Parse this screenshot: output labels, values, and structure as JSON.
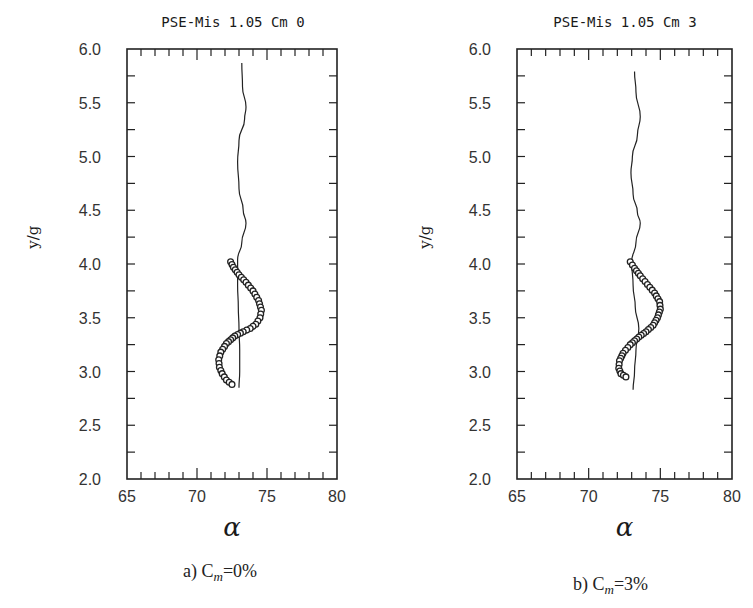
{
  "figure": {
    "panels": [
      {
        "id": "a",
        "title": "PSE-Mis  1.05  Cm  0",
        "ylabel": "y/g",
        "xlabel": "α",
        "caption_prefix": "a) C",
        "caption_sub": "m",
        "caption_suffix": "=0%",
        "xticks": [
          "65",
          "70",
          "75",
          "80"
        ],
        "yticks": [
          "2.0",
          "2.5",
          "3.0",
          "3.5",
          "4.0",
          "4.5",
          "5.0",
          "5.5",
          "6.0"
        ]
      },
      {
        "id": "b",
        "title": "PSE-Mis  1.05  Cm  3",
        "ylabel": "y/g",
        "xlabel": "α",
        "caption_prefix": "b) C",
        "caption_sub": "m",
        "caption_suffix": "=3%",
        "xticks": [
          "65",
          "70",
          "75",
          "80"
        ],
        "yticks": [
          "2.0",
          "2.5",
          "3.0",
          "3.5",
          "4.0",
          "4.5",
          "5.0",
          "5.5",
          "6.0"
        ]
      }
    ]
  },
  "chart_data": [
    {
      "type": "line",
      "title": "PSE-Mis 1.05 Cm 0",
      "caption": "a) Cm=0%",
      "xlabel": "α",
      "ylabel": "y/g",
      "xlim": [
        65,
        80
      ],
      "ylim": [
        2.0,
        6.0
      ],
      "xticks": [
        65,
        70,
        75,
        80
      ],
      "yticks": [
        2.0,
        2.5,
        3.0,
        3.5,
        4.0,
        4.5,
        5.0,
        5.5,
        6.0
      ],
      "grid": false,
      "legend": null,
      "series": [
        {
          "name": "line",
          "style": "solid line",
          "x": [
            73.2,
            73.25,
            73.5,
            73.4,
            73.0,
            72.9,
            73.0,
            73.3,
            73.5,
            73.2,
            72.9,
            72.9,
            72.95,
            73.0,
            73.05,
            73.05,
            73.0
          ],
          "y": [
            5.87,
            5.65,
            5.46,
            5.35,
            5.15,
            4.95,
            4.7,
            4.5,
            4.38,
            4.2,
            4.04,
            3.8,
            3.6,
            3.4,
            3.2,
            3.0,
            2.85
          ]
        },
        {
          "name": "circles",
          "style": "open circle markers",
          "x": [
            72.4,
            72.6,
            73.0,
            73.5,
            74.0,
            74.4,
            74.6,
            74.5,
            74.2,
            73.8,
            73.3,
            72.7,
            72.1,
            71.7,
            71.55,
            71.6,
            71.8,
            72.1,
            72.5
          ],
          "y": [
            4.02,
            3.97,
            3.9,
            3.83,
            3.75,
            3.66,
            3.57,
            3.5,
            3.44,
            3.4,
            3.37,
            3.33,
            3.26,
            3.18,
            3.11,
            3.04,
            2.98,
            2.92,
            2.88
          ]
        }
      ]
    },
    {
      "type": "line",
      "title": "PSE-Mis 1.05 Cm 3",
      "caption": "b) Cm=3%",
      "xlabel": "α",
      "ylabel": "y/g",
      "xlim": [
        65,
        80
      ],
      "ylim": [
        2.0,
        6.0
      ],
      "xticks": [
        65,
        70,
        75,
        80
      ],
      "yticks": [
        2.0,
        2.5,
        3.0,
        3.5,
        4.0,
        4.5,
        5.0,
        5.5,
        6.0
      ],
      "grid": false,
      "legend": null,
      "series": [
        {
          "name": "line",
          "style": "solid line",
          "x": [
            73.2,
            73.3,
            73.6,
            73.4,
            73.05,
            72.95,
            73.1,
            73.4,
            73.6,
            73.3,
            73.0,
            73.1,
            73.25,
            73.5,
            73.3,
            73.2,
            73.1
          ],
          "y": [
            5.79,
            5.6,
            5.37,
            5.2,
            5.0,
            4.85,
            4.65,
            4.48,
            4.38,
            4.2,
            4.02,
            3.8,
            3.6,
            3.4,
            3.2,
            3.0,
            2.83
          ]
        },
        {
          "name": "circles",
          "style": "open circle markers",
          "x": [
            72.9,
            73.2,
            73.6,
            74.1,
            74.6,
            74.95,
            75.0,
            74.8,
            74.5,
            74.0,
            73.5,
            72.9,
            72.4,
            72.15,
            72.1,
            72.25,
            72.6
          ],
          "y": [
            4.02,
            3.96,
            3.89,
            3.81,
            3.73,
            3.65,
            3.58,
            3.5,
            3.43,
            3.37,
            3.32,
            3.25,
            3.17,
            3.1,
            3.03,
            2.98,
            2.95
          ]
        }
      ]
    }
  ]
}
